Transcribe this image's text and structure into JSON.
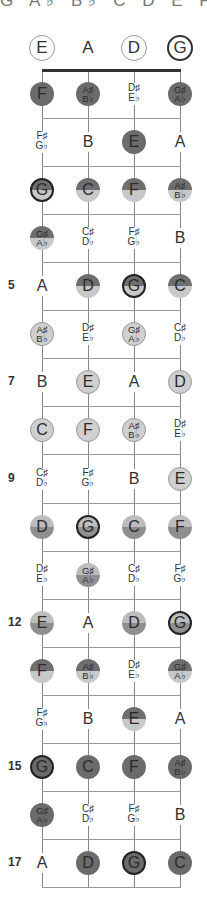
{
  "title": "G A♭ B♭ C D E F",
  "strings": [
    "E",
    "A",
    "D",
    "G"
  ],
  "open_strings": [
    {
      "label": "E",
      "style": "circ"
    },
    {
      "label": "A",
      "style": "none"
    },
    {
      "label": "D",
      "style": "circ"
    },
    {
      "label": "G",
      "style": "root"
    }
  ],
  "fret_numbers": {
    "5": "5",
    "7": "7",
    "9": "9",
    "12": "12",
    "15": "15",
    "17": "17"
  },
  "frets": [
    {
      "fret": 1,
      "notes": [
        {
          "label": "F",
          "style": "dark"
        },
        {
          "label": "A♯\nB♭",
          "style": "dark"
        },
        {
          "label": "D♯\nE♭",
          "style": "plain"
        },
        {
          "label": "G♯\nA♭",
          "style": "dark"
        }
      ]
    },
    {
      "fret": 2,
      "notes": [
        {
          "label": "F♯\nG♭",
          "style": "plain"
        },
        {
          "label": "B",
          "style": "plain"
        },
        {
          "label": "E",
          "style": "dark"
        },
        {
          "label": "A",
          "style": "plain"
        }
      ]
    },
    {
      "fret": 3,
      "notes": [
        {
          "label": "G",
          "style": "half root"
        },
        {
          "label": "C",
          "style": "half"
        },
        {
          "label": "F",
          "style": "half"
        },
        {
          "label": "A♯\nB♭",
          "style": "half"
        }
      ]
    },
    {
      "fret": 4,
      "notes": [
        {
          "label": "G♯\nA♭",
          "style": "half"
        },
        {
          "label": "C♯\nD♭",
          "style": "plain"
        },
        {
          "label": "F♯\nG♭",
          "style": "plain"
        },
        {
          "label": "B",
          "style": "plain"
        }
      ]
    },
    {
      "fret": 5,
      "notes": [
        {
          "label": "A",
          "style": "plain"
        },
        {
          "label": "D",
          "style": "half"
        },
        {
          "label": "G",
          "style": "half root"
        },
        {
          "label": "C",
          "style": "half"
        }
      ]
    },
    {
      "fret": 6,
      "notes": [
        {
          "label": "A♯\nB♭",
          "style": "light"
        },
        {
          "label": "D♯\nE♭",
          "style": "plain"
        },
        {
          "label": "G♯\nA♭",
          "style": "light"
        },
        {
          "label": "C♯\nD♭",
          "style": "plain"
        }
      ]
    },
    {
      "fret": 7,
      "notes": [
        {
          "label": "B",
          "style": "plain"
        },
        {
          "label": "E",
          "style": "light"
        },
        {
          "label": "A",
          "style": "plain"
        },
        {
          "label": "D",
          "style": "light"
        }
      ]
    },
    {
      "fret": 8,
      "notes": [
        {
          "label": "C",
          "style": "light"
        },
        {
          "label": "F",
          "style": "light"
        },
        {
          "label": "A♯\nB♭",
          "style": "light"
        },
        {
          "label": "D♯\nE♭",
          "style": "plain"
        }
      ]
    },
    {
      "fret": 9,
      "notes": [
        {
          "label": "C♯\nD♭",
          "style": "plain"
        },
        {
          "label": "F♯\nG♭",
          "style": "plain"
        },
        {
          "label": "B",
          "style": "plain"
        },
        {
          "label": "E",
          "style": "light"
        }
      ]
    },
    {
      "fret": 10,
      "notes": [
        {
          "label": "D",
          "style": "mid"
        },
        {
          "label": "G",
          "style": "mid root"
        },
        {
          "label": "C",
          "style": "mid"
        },
        {
          "label": "F",
          "style": "mid"
        }
      ]
    },
    {
      "fret": 11,
      "notes": [
        {
          "label": "D♯\nE♭",
          "style": "plain"
        },
        {
          "label": "G♯\nA♭",
          "style": "mid"
        },
        {
          "label": "C♯\nD♭",
          "style": "plain"
        },
        {
          "label": "F♯\nG♭",
          "style": "plain"
        }
      ]
    },
    {
      "fret": 12,
      "notes": [
        {
          "label": "E",
          "style": "mid"
        },
        {
          "label": "A",
          "style": "plain"
        },
        {
          "label": "D",
          "style": "mid"
        },
        {
          "label": "G",
          "style": "mid root"
        }
      ]
    },
    {
      "fret": 13,
      "notes": [
        {
          "label": "F",
          "style": "half"
        },
        {
          "label": "A♯\nB♭",
          "style": "half"
        },
        {
          "label": "D♯\nE♭",
          "style": "plain"
        },
        {
          "label": "G♯\nA♭",
          "style": "half"
        }
      ]
    },
    {
      "fret": 14,
      "notes": [
        {
          "label": "F♯\nG♭",
          "style": "plain"
        },
        {
          "label": "B",
          "style": "plain"
        },
        {
          "label": "E",
          "style": "half"
        },
        {
          "label": "A",
          "style": "plain"
        }
      ]
    },
    {
      "fret": 15,
      "notes": [
        {
          "label": "G",
          "style": "dark root"
        },
        {
          "label": "C",
          "style": "dark"
        },
        {
          "label": "F",
          "style": "dark"
        },
        {
          "label": "A♯\nB♭",
          "style": "dark"
        }
      ]
    },
    {
      "fret": 16,
      "notes": [
        {
          "label": "G♯\nA♭",
          "style": "dark"
        },
        {
          "label": "C♯\nD♭",
          "style": "plain"
        },
        {
          "label": "F♯\nG♭",
          "style": "plain"
        },
        {
          "label": "B",
          "style": "plain"
        }
      ]
    },
    {
      "fret": 17,
      "notes": [
        {
          "label": "A",
          "style": "plain"
        },
        {
          "label": "D",
          "style": "dark"
        },
        {
          "label": "G",
          "style": "dark root"
        },
        {
          "label": "C",
          "style": "dark"
        }
      ]
    }
  ],
  "colors": {
    "dark": "#6b6b6b",
    "light": "#cfcfcf",
    "line": "#999999",
    "nut": "#333333"
  }
}
